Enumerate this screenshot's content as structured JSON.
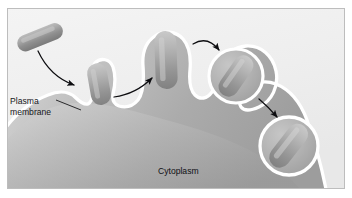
{
  "figure": {
    "width": 352,
    "height": 198,
    "frame": {
      "border_color": "#b9b9b9",
      "background_color": "#f2f2f2",
      "content_top": 8,
      "content_bottom": 189,
      "content_left": 7,
      "content_right": 345
    },
    "colors": {
      "extracellular_background": "#f1f1f1",
      "cytoplasm_light": "#cfcfcf",
      "cytoplasm_mid": "#b3b3b3",
      "cytoplasm_dark": "#9a9a9a",
      "membrane_highlight": "#ffffff",
      "bacterium_light": "#b8b8b8",
      "bacterium_mid": "#9b9b9b",
      "bacterium_dark": "#7d7d7d",
      "arrow_color": "#0d0d10",
      "label_color": "#17171a",
      "leader_line_color": "#17171a"
    }
  },
  "labels": [
    {
      "id": "plasma-membrane",
      "name": "plasma-membrane-label",
      "line1": "Plasma",
      "line2": "membrane",
      "x": 10,
      "y": 101,
      "line_height": 11,
      "has_leader": true
    },
    {
      "id": "cytoplasm",
      "name": "cytoplasm-label",
      "line1": "Cytoplasm",
      "line2": "",
      "x": 158,
      "y": 174,
      "line_height": 11,
      "has_leader": false
    }
  ],
  "stages": [
    {
      "id": "stage-1",
      "name": "free-bacterium",
      "description": "Free rod-shaped bacterium outside the cell",
      "cx": 40,
      "cy": 37,
      "rotation": -22
    },
    {
      "id": "stage-2",
      "name": "pseudopod-contact",
      "description": "Plasma membrane forms a pseudopod toward the bacterium",
      "cx": 98,
      "cy": 82,
      "rotation": -12
    },
    {
      "id": "stage-3",
      "name": "phagocytic-cup",
      "description": "Pseudopods surround the bacterium forming a phagocytic cup",
      "cx": 167,
      "cy": 55,
      "rotation": 0
    },
    {
      "id": "stage-4",
      "name": "closing-vacuole",
      "description": "Membrane closes around the bacterium forming a vacuole",
      "cx": 236,
      "cy": 73,
      "rotation": 35
    },
    {
      "id": "stage-5",
      "name": "free-phagosome",
      "description": "Detached phagosome with the bacterium inside the cytoplasm",
      "cx": 288,
      "cy": 146,
      "rotation": 38
    }
  ],
  "arrows": [
    {
      "id": "arrow-1",
      "name": "arrow-bacterium-to-pseudopod",
      "from_stage": "stage-1",
      "to_stage": "stage-2",
      "path": "M 38 51 C 45 66 58 79 76 86"
    },
    {
      "id": "arrow-2",
      "name": "arrow-pseudopod-to-cup",
      "from_stage": "stage-2",
      "to_stage": "stage-3",
      "path": "M 114 96 C 129 94 142 87 153 77"
    },
    {
      "id": "arrow-3",
      "name": "arrow-cup-to-vacuole",
      "from_stage": "stage-3",
      "to_stage": "stage-4",
      "path": "M 192 44 C 202 38 212 40 220 50"
    },
    {
      "id": "arrow-4",
      "name": "arrow-vacuole-to-phagosome",
      "from_stage": "stage-4",
      "to_stage": "stage-5",
      "path": "M 259 99 C 266 105 271 110 277 117"
    }
  ],
  "leader_lines": [
    {
      "id": "leader-plasma-membrane",
      "name": "plasma-membrane-leader-line",
      "path": "M 56 101 L 80 110"
    }
  ]
}
